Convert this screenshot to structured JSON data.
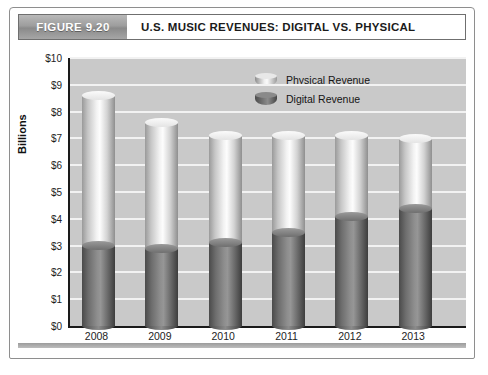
{
  "figure": {
    "badge": "FIGURE 9.20",
    "title": "U.S. MUSIC REVENUES: DIGITAL VS. PHYSICAL"
  },
  "chart_data": {
    "type": "bar",
    "subtype": "stacked-column-3d",
    "title": "U.S. MUSIC REVENUES: DIGITAL VS. PHYSICAL",
    "categories": [
      "2008",
      "2009",
      "2010",
      "2011",
      "2012",
      "2013"
    ],
    "series": [
      {
        "name": "Digital Revenue",
        "values": [
          3.0,
          2.9,
          3.1,
          3.5,
          4.1,
          4.4
        ],
        "color": "#6b6b6b"
      },
      {
        "name": "Physical Revenue",
        "values": [
          5.6,
          4.7,
          4.0,
          3.6,
          3.0,
          2.6
        ],
        "color": "#e9e9e9"
      }
    ],
    "totals": [
      8.6,
      7.6,
      7.1,
      7.1,
      7.1,
      7.0
    ],
    "xlabel": "",
    "ylabel": "Billions",
    "ylim": [
      0,
      10
    ],
    "ytick_step": 1,
    "yticks": [
      "$0",
      "$1",
      "$2",
      "$3",
      "$4",
      "$5",
      "$6",
      "$7",
      "$8",
      "$9",
      "$10"
    ],
    "grid": true,
    "legend_position": "top-center",
    "plot_background": "#c9c9c9",
    "gridline_color": "#f2f2f2"
  },
  "legend": {
    "items": [
      {
        "label": "Physical Revenue"
      },
      {
        "label": "Digital Revenue"
      }
    ]
  }
}
